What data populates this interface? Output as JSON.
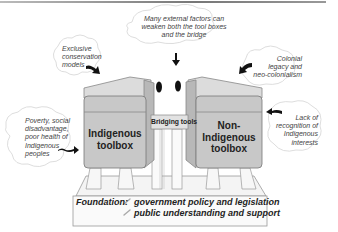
{
  "diagram": {
    "clouds": [
      {
        "id": "exclusive",
        "text_lines": [
          "Exclusive",
          "conservation",
          "models"
        ]
      },
      {
        "id": "external",
        "text_lines": [
          "Many external factors can",
          "weaken both the tool boxes",
          "and the bridge"
        ]
      },
      {
        "id": "colonial",
        "text_lines": [
          "Colonial",
          "legacy and",
          "neo-colonialism"
        ]
      },
      {
        "id": "poverty",
        "text_lines": [
          "Poverty, social",
          "disadvantage,",
          "poor health of",
          "Indigenous",
          "peoples"
        ]
      },
      {
        "id": "lack",
        "text_lines": [
          "Lack of",
          "recognition of",
          "Indigenous",
          "interests"
        ]
      }
    ],
    "indigenous_toolbox": {
      "lines": [
        "Indigenous",
        "toolbox"
      ]
    },
    "non_indigenous_toolbox": {
      "lines": [
        "Non-",
        "Indigenous",
        "toolbox"
      ]
    },
    "bridge": {
      "label": "Bridging tools"
    },
    "foundation": {
      "label": "Foundation:",
      "items": [
        "government policy and legislation",
        "public understanding and support"
      ]
    },
    "colors": {
      "box_fill": "#c8c8c8",
      "box_top": "#dcdcdc",
      "box_stroke": "#777777",
      "handle": "#111111",
      "arrow": "#111111"
    }
  }
}
